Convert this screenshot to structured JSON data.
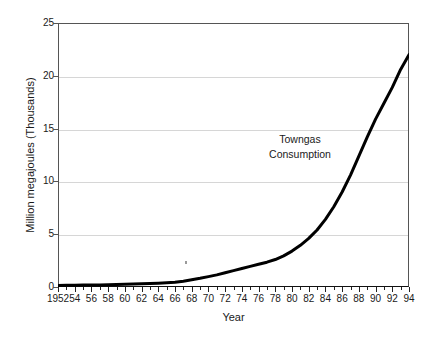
{
  "chart_data": {
    "type": "line",
    "title": "",
    "xlabel": "Year",
    "ylabel": "Million megajoules  (Thousands)",
    "xlim": [
      1952,
      1994
    ],
    "ylim": [
      0,
      25
    ],
    "grid": true,
    "legend": "none",
    "annotations": [
      {
        "text_line1": "Towngas",
        "text_line2": "Consumption",
        "x": 1983,
        "y": 13.5
      }
    ],
    "y_ticks": [
      0,
      5,
      10,
      15,
      20,
      25
    ],
    "y_tick_labels": [
      "0",
      "5",
      "10",
      "15",
      "20",
      "25"
    ],
    "x_ticks": [
      1952,
      1954,
      1956,
      1958,
      1960,
      1962,
      1964,
      1966,
      1968,
      1970,
      1972,
      1974,
      1976,
      1978,
      1980,
      1982,
      1984,
      1986,
      1988,
      1990,
      1992,
      1994
    ],
    "x_tick_labels": [
      "1952",
      "54",
      "56",
      "58",
      "60",
      "62",
      "64",
      "66",
      "68",
      "70",
      "72",
      "74",
      "76",
      "78",
      "80",
      "82",
      "84",
      "86",
      "88",
      "90",
      "92",
      "94"
    ],
    "series": [
      {
        "name": "Towngas Consumption",
        "color": "#000000",
        "linewidth": 3,
        "x": [
          1952,
          1953,
          1954,
          1955,
          1956,
          1957,
          1958,
          1959,
          1960,
          1961,
          1962,
          1963,
          1964,
          1965,
          1966,
          1967,
          1968,
          1969,
          1970,
          1971,
          1972,
          1973,
          1974,
          1975,
          1976,
          1977,
          1978,
          1979,
          1980,
          1981,
          1982,
          1983,
          1984,
          1985,
          1986,
          1987,
          1988,
          1989,
          1990,
          1991,
          1992,
          1993,
          1994
        ],
        "values": [
          0.15,
          0.16,
          0.17,
          0.18,
          0.19,
          0.2,
          0.22,
          0.24,
          0.26,
          0.28,
          0.3,
          0.33,
          0.36,
          0.4,
          0.45,
          0.55,
          0.68,
          0.82,
          0.98,
          1.15,
          1.35,
          1.55,
          1.75,
          1.95,
          2.15,
          2.35,
          2.6,
          2.95,
          3.4,
          3.95,
          4.6,
          5.4,
          6.4,
          7.6,
          9.0,
          10.6,
          12.4,
          14.2,
          15.9,
          17.4,
          18.9,
          20.6,
          22.0
        ]
      }
    ]
  },
  "axis": {
    "y_title": "Million megajoules  (Thousands)",
    "x_title": "Year"
  },
  "annotation": {
    "line1": "Towngas",
    "line2": "Consumption"
  },
  "colors": {
    "line": "#000000",
    "grid": "#d6d6d6",
    "frame": "#555555",
    "text": "#1a1a1a",
    "background": "#ffffff"
  }
}
